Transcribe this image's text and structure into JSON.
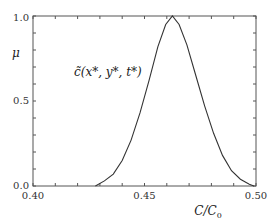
{
  "chart_data": {
    "type": "line",
    "title": "",
    "xlabel": "C/C₀",
    "ylabel": "μ",
    "xlim": [
      0.4,
      0.5
    ],
    "ylim": [
      0.0,
      1.0
    ],
    "x_ticks": [
      {
        "value": 0.4,
        "label": "0.40"
      },
      {
        "value": 0.45,
        "label": "0.45"
      },
      {
        "value": 0.5,
        "label": "0.50"
      }
    ],
    "y_ticks": [
      {
        "value": 0.0,
        "label": "0.0"
      },
      {
        "value": 0.5,
        "label": "0.5"
      },
      {
        "value": 1.0,
        "label": "1.0"
      }
    ],
    "x_minor_step": 0.01,
    "y_minor_step": 0.1,
    "grid": false,
    "legend": null,
    "annotations": [
      {
        "text": "c̃(x*, y*, t*)",
        "x": 0.418,
        "y": 0.67
      }
    ],
    "series": [
      {
        "name": "c̃(x*, y*, t*)",
        "x": [
          0.428,
          0.432,
          0.436,
          0.44,
          0.444,
          0.448,
          0.452,
          0.456,
          0.4595,
          0.4625,
          0.4655,
          0.469,
          0.473,
          0.477,
          0.481,
          0.485,
          0.489,
          0.493,
          0.497,
          0.499
        ],
        "y": [
          0.0,
          0.03,
          0.07,
          0.15,
          0.27,
          0.43,
          0.62,
          0.82,
          0.95,
          1.0,
          0.95,
          0.83,
          0.65,
          0.47,
          0.31,
          0.18,
          0.09,
          0.04,
          0.01,
          0.0
        ]
      }
    ]
  },
  "labels": {
    "y_axis": "μ",
    "x_axis_main": "C/C",
    "x_axis_sub": "0",
    "curve_main": "c̃(x*, y*, t*)",
    "tick_x0": "0.40",
    "tick_x1": "0.45",
    "tick_x2": "0.50",
    "tick_y0": "0.0",
    "tick_y1": "0.5",
    "tick_y2": "1.0"
  }
}
